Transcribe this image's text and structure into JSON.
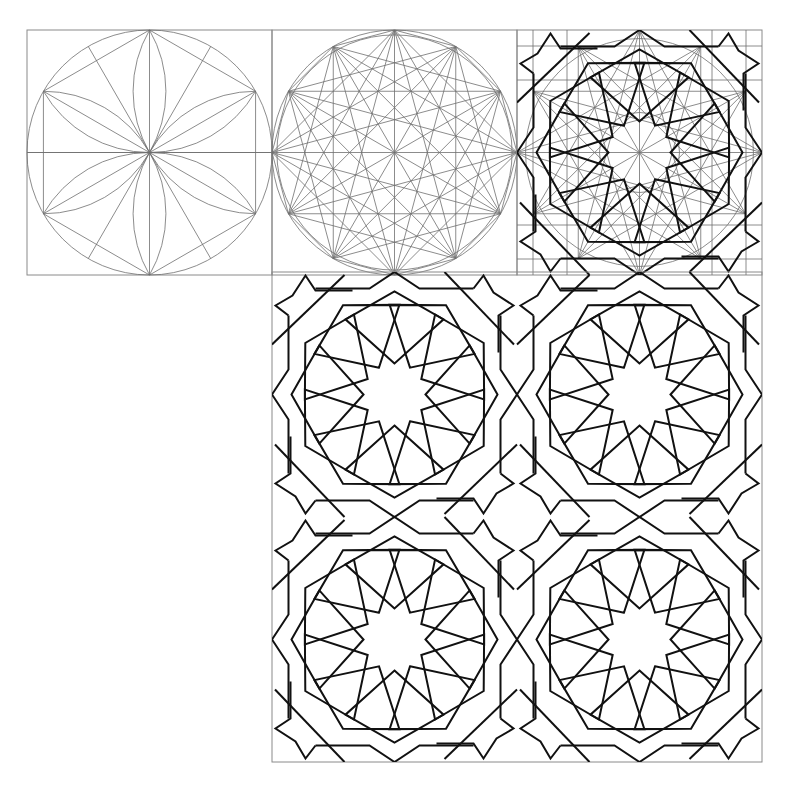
{
  "figure": {
    "colors": {
      "background": "#ffffff",
      "construction_line": "#6f6f6f",
      "pattern_line": "#111111",
      "frame": "#8a8a8a"
    },
    "tile_size": 245,
    "panels": [
      {
        "id": "step-1",
        "label": "circle divided into 12 with lens arcs",
        "x": 27,
        "y": 30,
        "size": 245
      },
      {
        "id": "step-2",
        "label": "dodecagon with star polygons",
        "x": 272,
        "y": 30,
        "size": 245
      },
      {
        "id": "step-3",
        "label": "pattern lines over construction grid",
        "x": 517,
        "y": 30,
        "size": 245
      },
      {
        "id": "final-pattern",
        "label": "2x2 repeat of 12-point rosette pattern",
        "x": 272,
        "y": 272,
        "size": 490,
        "tiles_x": 2,
        "tiles_y": 2
      }
    ],
    "rosette": {
      "points": 12,
      "star_inner_radius": 31,
      "star_tip_radius": 42,
      "petal_side_angle_deg": 48,
      "petal_side_length": 66,
      "petal_outer_radius": 103
    },
    "tile_frame": {
      "edge_offset": 106,
      "top_offset": 104,
      "edge_hex_half_height": 25,
      "corner_star_reach": 119
    }
  }
}
